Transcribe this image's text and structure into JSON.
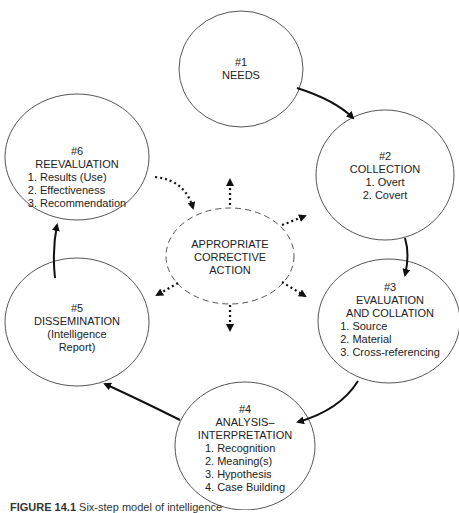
{
  "nodes": {
    "needs": {
      "number": "#1",
      "title": "NEEDS"
    },
    "collection": {
      "number": "#2",
      "title": "COLLECTION",
      "items": [
        "1. Overt",
        "2. Covert"
      ]
    },
    "evaluation": {
      "number": "#3",
      "title_line1": "EVALUATION",
      "title_line2": "AND COLLATION",
      "items": [
        "1. Source",
        "2. Material",
        "3. Cross-referencing"
      ]
    },
    "analysis": {
      "number": "#4",
      "title_line1": "ANALYSIS–",
      "title_line2": "INTERPRETATION",
      "items": [
        "1. Recognition",
        "2. Meaning(s)",
        "3. Hypothesis",
        "4. Case Building"
      ]
    },
    "dissemination": {
      "number": "#5",
      "title": "DISSEMINATION",
      "sub_line1": "(Intelligence",
      "sub_line2": "Report)"
    },
    "reevaluation": {
      "number": "#6",
      "title": "REEVALUATION",
      "items": [
        "1. Results (Use)",
        "2. Effectiveness",
        "3. Recommendation"
      ]
    },
    "center": {
      "line1": "APPROPRIATE",
      "line2": "CORRECTIVE",
      "line3": "ACTION"
    }
  },
  "caption": {
    "label": "FIGURE 14.1",
    "text": "Six-step model of intelligence"
  },
  "colors": {
    "stroke": "#333333",
    "arrow": "#111111"
  }
}
